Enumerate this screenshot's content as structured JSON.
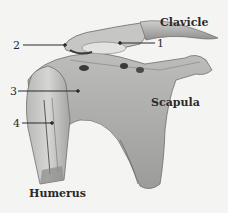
{
  "diagram": {
    "type": "anatomical-illustration",
    "structures": [
      {
        "id": "clavicle",
        "label": "Clavicle"
      },
      {
        "id": "scapula",
        "label": "Scapula"
      },
      {
        "id": "humerus",
        "label": "Humerus"
      }
    ],
    "callouts": [
      {
        "number": "1",
        "target": "coracoid-region"
      },
      {
        "number": "2",
        "target": "acromion-region"
      },
      {
        "number": "3",
        "target": "humeral-head-region"
      },
      {
        "number": "4",
        "target": "humeral-shaft-region"
      }
    ],
    "colors": {
      "background": "#f4f4f2",
      "bone_light": "#d4d4d2",
      "bone_mid": "#a8a8a6",
      "bone_dark": "#6a6a68",
      "ink": "#2a2a2a"
    }
  }
}
